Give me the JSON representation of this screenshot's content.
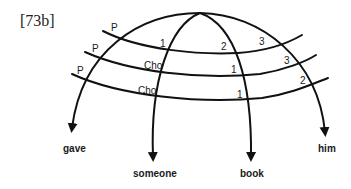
{
  "example_label": "[73b]",
  "diagram": {
    "arcs": [
      {
        "word": "gave",
        "position": "outer-left"
      },
      {
        "word": "someone",
        "position": "inner-left"
      },
      {
        "word": "book",
        "position": "inner-right"
      },
      {
        "word": "him",
        "position": "outer-right"
      }
    ],
    "bands": [
      {
        "row": 1,
        "labels": {
          "left": "P",
          "mid_left": "1",
          "mid_right": "2",
          "right": "3"
        }
      },
      {
        "row": 2,
        "labels": {
          "left": "P",
          "mid_left": "Cho",
          "mid_right": "1",
          "right": "3"
        }
      },
      {
        "row": 3,
        "labels": {
          "left": "P",
          "mid_left": "Cho",
          "mid_right": "1",
          "right": "2"
        }
      }
    ]
  }
}
